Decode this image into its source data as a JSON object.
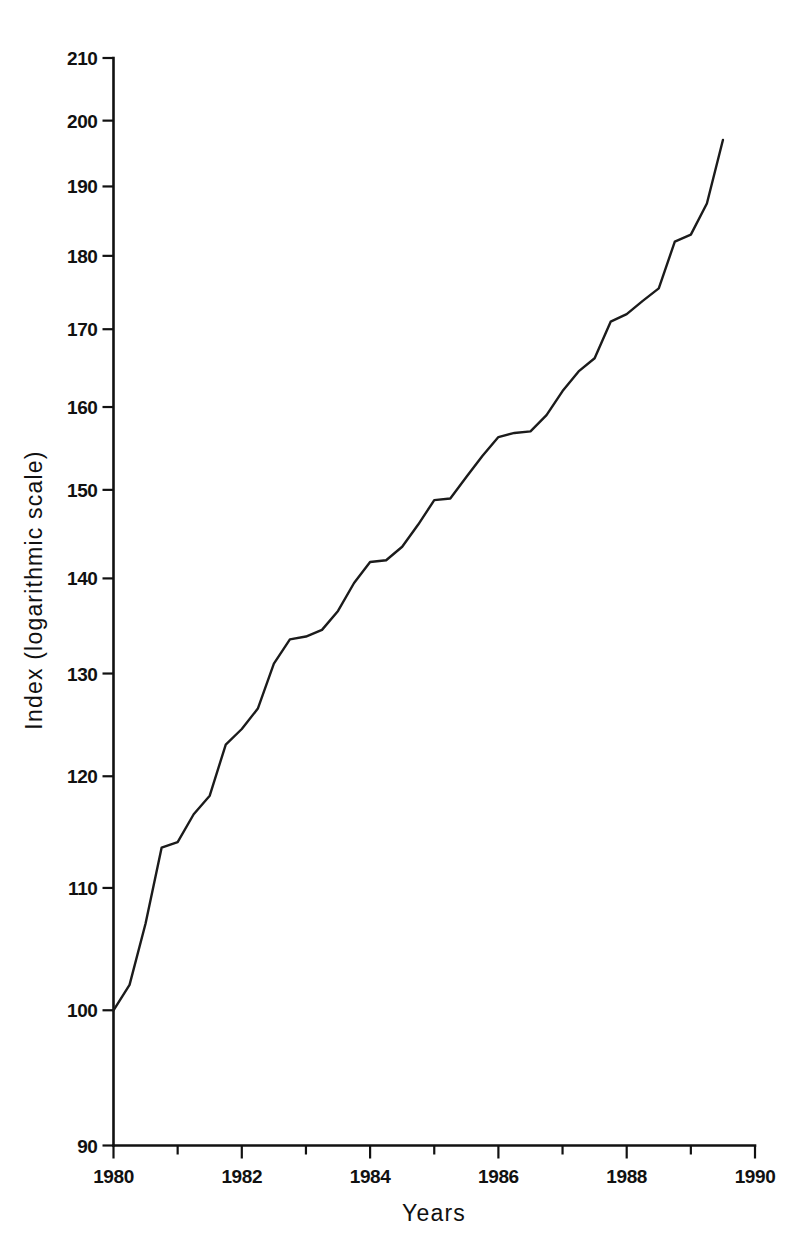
{
  "chart_data": {
    "type": "line",
    "title": "",
    "subtitle": "",
    "xlabel": "Years",
    "ylabel": "Index (logarithmic scale)",
    "yscale": "log",
    "xscale": "linear",
    "xlim": [
      1980,
      1990
    ],
    "ylim": [
      90,
      210
    ],
    "grid": false,
    "legend": null,
    "y_ticks": [
      90,
      100,
      110,
      120,
      130,
      140,
      150,
      160,
      170,
      180,
      190,
      200,
      210
    ],
    "y_tick_labels": [
      "90",
      "100",
      "110",
      "120",
      "130",
      "140",
      "150",
      "160",
      "170",
      "180",
      "190",
      "200",
      "210"
    ],
    "x_ticks_major": [
      1980,
      1982,
      1984,
      1986,
      1988,
      1990
    ],
    "x_tick_labels": [
      "1980",
      "1982",
      "1984",
      "1986",
      "1988",
      "1990"
    ],
    "x_ticks_minor": [
      1981,
      1983,
      1985,
      1987,
      1989
    ],
    "series": [
      {
        "name": "Index",
        "x": [
          1980.0,
          1980.25,
          1980.5,
          1980.75,
          1981.0,
          1981.25,
          1981.5,
          1981.75,
          1982.0,
          1982.25,
          1982.5,
          1982.75,
          1983.0,
          1983.25,
          1983.5,
          1983.75,
          1984.0,
          1984.25,
          1984.5,
          1984.75,
          1985.0,
          1985.25,
          1985.5,
          1985.75,
          1986.0,
          1986.25,
          1986.5,
          1986.75,
          1987.0,
          1987.25,
          1987.5,
          1987.75,
          1988.0,
          1988.25,
          1988.5,
          1988.75,
          1989.0,
          1989.25,
          1989.5
        ],
        "y": [
          100.0,
          102.0,
          107.0,
          113.5,
          114.0,
          116.5,
          118.2,
          123.0,
          124.5,
          126.5,
          131.0,
          133.5,
          133.8,
          134.5,
          136.5,
          139.5,
          141.8,
          142.0,
          143.5,
          146.0,
          148.8,
          149.0,
          151.5,
          154.0,
          156.3,
          156.8,
          157.0,
          159.0,
          162.0,
          164.5,
          166.2,
          171.0,
          172.0,
          173.8,
          175.5,
          182.0,
          183.0,
          187.5,
          197.0
        ]
      }
    ]
  },
  "figure": {
    "background_color": "#ffffff",
    "line_color": "#1b1b1b",
    "axis_color": "#111111"
  }
}
